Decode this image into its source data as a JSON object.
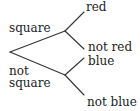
{
  "diagram": {
    "type": "tree",
    "root": {
      "branches": [
        {
          "label": "square",
          "children": [
            {
              "label": "red"
            },
            {
              "label": "not red"
            }
          ]
        },
        {
          "label_line1": "not",
          "label_line2": "square",
          "label": "not square",
          "children": [
            {
              "label": "blue"
            },
            {
              "label": "not blue"
            }
          ]
        }
      ]
    }
  },
  "colors": {
    "line": "#333333",
    "text": "#222222",
    "background": "#ffffff"
  }
}
